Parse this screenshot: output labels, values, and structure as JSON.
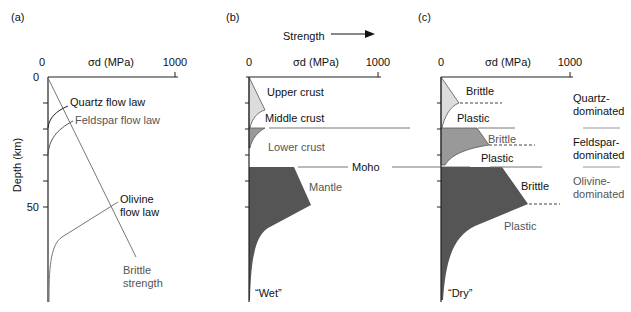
{
  "panels": {
    "a": {
      "label": "(a)",
      "x_axis_label": "σd (MPa)",
      "x_tick_0": "0",
      "x_tick_1000": "1000",
      "y_axis_label": "Depth (km)",
      "y_tick_0": "0",
      "y_tick_50": "50",
      "quartz": "Quartz flow law",
      "feldspar": "Feldspar flow law",
      "olivine_1": "Olivine",
      "olivine_2": "flow law",
      "brittle_1": "Brittle",
      "brittle_2": "strength"
    },
    "b": {
      "label": "(b)",
      "strength": "Strength",
      "x_axis_label": "σd (MPa)",
      "x_tick_0": "0",
      "x_tick_1000": "1000",
      "upper_crust": "Upper crust",
      "middle_crust": "Middle crust",
      "lower_crust": "Lower crust",
      "moho": "Moho",
      "mantle": "Mantle",
      "condition": "“Wet”"
    },
    "c": {
      "label": "(c)",
      "x_axis_label": "σd (MPa)",
      "x_tick_0": "0",
      "x_tick_1000": "1000",
      "brittle_1": "Brittle",
      "plastic_1": "Plastic",
      "brittle_2": "Brittle",
      "plastic_2": "Plastic",
      "brittle_3": "Brittle",
      "plastic_3": "Plastic",
      "quartz_1": "Quartz-",
      "quartz_2": "dominated",
      "feldspar_1": "Feldspar-",
      "feldspar_2": "dominated",
      "olivine_1": "Olivine-",
      "olivine_2": "dominated",
      "condition": "“Dry”"
    }
  },
  "colors": {
    "light_fill": "#dcdcdc",
    "mid_fill": "#9a9a9a",
    "dark_fill": "#555555",
    "line": "#222222",
    "gray_line": "#777777"
  }
}
